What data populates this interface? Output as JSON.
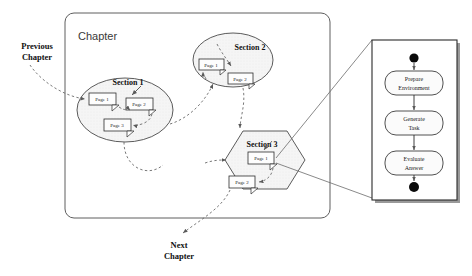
{
  "diagram": {
    "type": "structure-diagram",
    "chapter": {
      "title": "Chapter"
    },
    "external_labels": [
      {
        "id": "previous-chapter",
        "line1": "Previous",
        "line2": "Chapter"
      },
      {
        "id": "next-chapter",
        "line1": "Next",
        "line2": "Chapter"
      }
    ],
    "sections": [
      {
        "id": "section-1",
        "title": "Section 1",
        "shape": "ellipse",
        "pages": [
          {
            "label": "Page 1"
          },
          {
            "label": "Page 2"
          },
          {
            "label": "Page 3"
          }
        ]
      },
      {
        "id": "section-2",
        "title": "Section 2",
        "shape": "ellipse",
        "pages": [
          {
            "label": "Page 1"
          },
          {
            "label": "Page 2"
          }
        ]
      },
      {
        "id": "section-3",
        "title": "Section 3",
        "shape": "hexagon",
        "pages": [
          {
            "label": "Page 1"
          },
          {
            "label": "Page 2"
          }
        ]
      }
    ],
    "activity_panel": {
      "id": "activity-panel",
      "start_node": "filled-circle",
      "end_node": "filled-circle",
      "activities": [
        {
          "line1": "Prepare",
          "line2": "Environment"
        },
        {
          "line1": "Generate",
          "line2": "Task"
        },
        {
          "line1": "Evaluate",
          "line2": "Answer"
        }
      ]
    },
    "colors": {
      "group_fill": "#f4f4f4",
      "group_stroke": "#4a4a4a",
      "connector": "#6a6a6a",
      "text": "#101010",
      "node": "#0a0a0a"
    }
  }
}
